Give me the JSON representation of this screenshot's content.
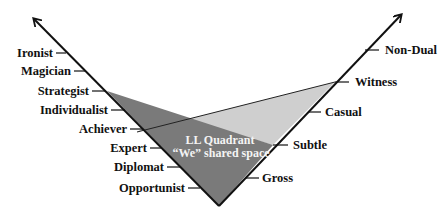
{
  "diagram": {
    "colors": {
      "dark_region": "#7a7a7a",
      "light_region": "#cfcfcf",
      "axis": "#111111",
      "inner_text": "#f4f4f4"
    },
    "left_axis": {
      "labels": [
        "Ironist",
        "Magician",
        "Strategist",
        "Individualist",
        "Achiever",
        "Expert",
        "Diplomat",
        "Opportunist"
      ]
    },
    "right_axis": {
      "labels": [
        "Non-Dual",
        "Witness",
        "Casual",
        "Subtle",
        "Gross"
      ]
    },
    "center": {
      "line1": "LL Quadrant",
      "line2": "“We” shared space"
    }
  }
}
